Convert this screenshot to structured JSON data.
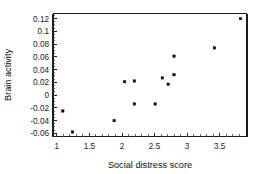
{
  "chart_data": {
    "type": "scatter",
    "title": "",
    "xlabel": "Social distress score",
    "ylabel": "Brain activity",
    "xlim": [
      0.94,
      3.92
    ],
    "ylim": [
      -0.065,
      0.128
    ],
    "xticks": [
      "1",
      "1.5",
      "2",
      "2.5",
      "3",
      "3.5"
    ],
    "xtick_values": [
      1,
      1.5,
      2,
      2.5,
      3,
      3.5
    ],
    "yticks": [
      "0.12",
      "0.1",
      "0.08",
      "0.06",
      "0.04",
      "0.02",
      "0",
      "-0.02",
      "-0.04",
      "-0.06"
    ],
    "ytick_values": [
      0.12,
      0.1,
      0.08,
      0.06,
      0.04,
      0.02,
      0,
      -0.02,
      -0.04,
      -0.06
    ],
    "grid": false,
    "legend": false,
    "marker": "square",
    "marker_color": "#0d0d0d",
    "points": [
      {
        "x": 1.09,
        "y": -0.025
      },
      {
        "x": 1.24,
        "y": -0.058
      },
      {
        "x": 1.88,
        "y": -0.04
      },
      {
        "x": 2.04,
        "y": 0.021
      },
      {
        "x": 2.19,
        "y": 0.022
      },
      {
        "x": 2.19,
        "y": -0.014
      },
      {
        "x": 2.51,
        "y": -0.014
      },
      {
        "x": 2.62,
        "y": 0.027
      },
      {
        "x": 2.71,
        "y": 0.017
      },
      {
        "x": 2.8,
        "y": 0.032
      },
      {
        "x": 2.8,
        "y": 0.061
      },
      {
        "x": 3.42,
        "y": 0.074
      },
      {
        "x": 3.82,
        "y": 0.12
      }
    ]
  },
  "axes": {
    "x_title": "Social distress score",
    "y_title": "Brain activity",
    "x_tick_labels": [
      "1",
      "1.5",
      "2",
      "2.5",
      "3",
      "3.5"
    ],
    "y_tick_labels": [
      "0.12",
      "0.1",
      "0.08",
      "0.06",
      "0.04",
      "0.02",
      "0",
      "-0.02",
      "-0.04",
      "-0.06"
    ]
  },
  "colors": {
    "axis": "#1c1c1c",
    "marker": "#0d0d0d",
    "background": "#ffffff",
    "text": "#111111"
  }
}
